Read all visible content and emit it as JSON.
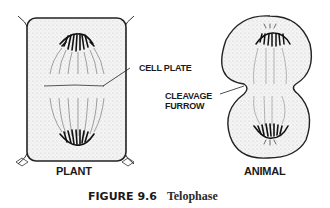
{
  "figure": {
    "number": "FIGURE 9.6",
    "title": "Telophase"
  },
  "panels": [
    {
      "id": "plant",
      "label": "PLANT"
    },
    {
      "id": "animal",
      "label": "ANIMAL"
    }
  ],
  "callouts": {
    "cell_plate": "CELL PLATE",
    "cleavage_furrow_line1": "CLEAVAGE",
    "cleavage_furrow_line2": "FURROW"
  },
  "colors": {
    "ink": "#1a1a1a",
    "stipple": "#c8c8c8",
    "background": "#ffffff"
  }
}
